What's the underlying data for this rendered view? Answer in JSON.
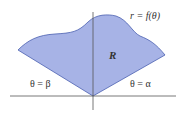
{
  "diagram": {
    "type": "polar-region",
    "region_fill": "#a7b3e6",
    "region_stroke": "#4a5fb0",
    "axis_color": "#555555",
    "labels": {
      "curve": "r = f(θ)",
      "region": "R",
      "left_ray": "θ = β",
      "right_ray": "θ = α"
    }
  }
}
